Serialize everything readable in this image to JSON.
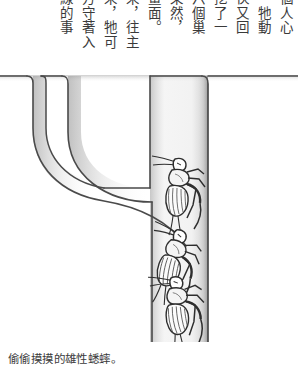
{
  "page": {
    "background_color": "#ffffff",
    "ink_color": "#3a3a3a"
  },
  "body_text": {
    "orientation": "vertical-rl",
    "note": "columns listed right-to-left as they read; top character of each column is clipped by the page crop",
    "columns": [
      "個人心",
      "，牠動",
      "伙又回",
      "挖了一",
      "六個巢",
      "果然，",
      "畫面。",
      "來，往主",
      "來，牠可",
      "方守著入",
      "線的事"
    ]
  },
  "caption": {
    "text": "偷偷摸摸的雄性蟋蟀。"
  },
  "illustration": {
    "type": "pen-and-ink cross-section diagram",
    "subject": "cricket burrow cross-section with three crickets",
    "ground_line_label": "soil surface",
    "openings": 3,
    "crickets": 3,
    "line_color": "#4a4a4a",
    "shading_color": "#b9b9b9"
  }
}
